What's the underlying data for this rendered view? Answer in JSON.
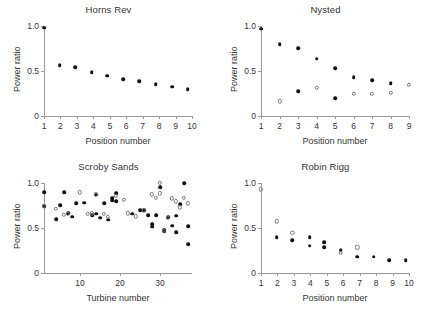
{
  "figure": {
    "panel_count": 4,
    "marker_colors": {
      "filled": "#111111",
      "open_stroke": "#777777",
      "axis": "#999999",
      "text": "#333333"
    }
  },
  "panels": [
    {
      "key": "horns_rev",
      "title": "Horns Rev",
      "xlabel": "Position number",
      "ylabel": "Power ratio",
      "yticks": [
        "1.0",
        "0.5",
        "0"
      ],
      "xticks": [
        "1",
        "2",
        "3",
        "4",
        "5",
        "6",
        "7",
        "8",
        "9",
        "10"
      ]
    },
    {
      "key": "nysted",
      "title": "Nysted",
      "xlabel": "Position number",
      "ylabel": "Power ratio",
      "yticks": [
        "1.0",
        "0.5",
        "0"
      ],
      "xticks": [
        "1",
        "2",
        "3",
        "4",
        "5",
        "6",
        "7",
        "8",
        "9"
      ]
    },
    {
      "key": "scroby_sands",
      "title": "Scroby Sands",
      "xlabel": "Turbine number",
      "ylabel": "Power ratio",
      "yticks": [
        "1.0",
        "0.5",
        "0"
      ],
      "xticks": [
        "10",
        "20",
        "30"
      ]
    },
    {
      "key": "robin_rigg",
      "title": "Robin Rigg",
      "xlabel": "Position number",
      "ylabel": "Power ratio",
      "yticks": [
        "1.0",
        "0.5",
        "0"
      ],
      "xticks": [
        "1",
        "2",
        "3",
        "4",
        "5",
        "6",
        "7",
        "8",
        "9",
        "10"
      ]
    }
  ],
  "chart_data": [
    {
      "type": "scatter",
      "title": "Horns Rev",
      "xlabel": "Position number",
      "ylabel": "Power ratio",
      "xlim": [
        1,
        10
      ],
      "ylim": [
        0,
        1.0
      ],
      "xticks": [
        1,
        2,
        3,
        4,
        5,
        6,
        7,
        8,
        9,
        10
      ],
      "yticks": [
        0,
        0.5,
        1.0
      ],
      "grid": false,
      "legend": "none",
      "series": [
        {
          "name": "power ratio (filled)",
          "marker": "filled-circle",
          "x": [
            1.0,
            1.95,
            2.9,
            3.9,
            4.85,
            5.8,
            6.8,
            7.8,
            8.8,
            9.75
          ],
          "y": [
            0.98,
            0.565,
            0.54,
            0.485,
            0.45,
            0.41,
            0.385,
            0.355,
            0.325,
            0.3
          ]
        }
      ]
    },
    {
      "type": "scatter",
      "title": "Nysted",
      "xlabel": "Position number",
      "ylabel": "Power ratio",
      "xlim": [
        1,
        9
      ],
      "ylim": [
        0,
        1.0
      ],
      "xticks": [
        1,
        2,
        3,
        4,
        5,
        6,
        7,
        8,
        9
      ],
      "yticks": [
        0,
        0.5,
        1.0
      ],
      "grid": false,
      "legend": "none",
      "series": [
        {
          "name": "upper (filled)",
          "marker": "filled-circle",
          "x": [
            1.0,
            2.0,
            3.0,
            4.0,
            5.0,
            6.0,
            7.0,
            8.0
          ],
          "y": [
            0.97,
            0.8,
            0.755,
            0.635,
            0.53,
            0.43,
            0.395,
            0.365
          ]
        },
        {
          "name": "lower (filled)",
          "marker": "filled-circle",
          "x": [
            3.0,
            5.0
          ],
          "y": [
            0.275,
            0.2
          ]
        },
        {
          "name": "open",
          "marker": "open-circle",
          "x": [
            2.0,
            4.0,
            6.0,
            7.0,
            8.0,
            9.0
          ],
          "y": [
            0.165,
            0.315,
            0.245,
            0.245,
            0.26,
            0.35
          ]
        }
      ]
    },
    {
      "type": "scatter",
      "title": "Scroby Sands",
      "xlabel": "Turbine number",
      "ylabel": "Power ratio",
      "xlim": [
        1,
        38
      ],
      "ylim": [
        0,
        1.0
      ],
      "xticks": [
        10,
        20,
        30
      ],
      "yticks": [
        0,
        0.5,
        1.0
      ],
      "grid": false,
      "legend": "none",
      "series": [
        {
          "name": "filled",
          "marker": "filled-circle",
          "x": [
            1,
            1,
            4,
            5,
            6,
            7,
            8,
            9,
            11,
            13,
            14,
            14,
            15,
            16,
            17,
            18,
            18,
            19,
            19,
            23,
            25,
            26,
            27,
            28,
            28,
            29,
            30,
            31,
            31,
            32,
            33,
            34,
            34,
            35,
            36,
            37,
            37
          ],
          "y": [
            0.9,
            0.745,
            0.6,
            0.755,
            0.9,
            0.665,
            0.625,
            0.775,
            0.78,
            0.645,
            0.87,
            0.66,
            0.615,
            0.775,
            0.59,
            0.81,
            0.835,
            0.8,
            0.885,
            0.66,
            0.7,
            0.695,
            0.64,
            0.545,
            0.515,
            0.645,
            0.955,
            0.465,
            0.48,
            0.62,
            0.525,
            0.455,
            0.635,
            0.765,
            1.0,
            0.52,
            0.32
          ]
        },
        {
          "name": "open",
          "marker": "open-circle",
          "x": [
            1,
            4,
            6,
            7,
            10,
            12,
            13,
            14,
            16,
            17,
            19,
            21,
            22,
            24,
            26,
            28,
            29,
            30,
            30,
            31,
            32,
            33,
            34,
            35,
            36,
            37
          ],
          "y": [
            0.745,
            0.715,
            0.645,
            0.66,
            0.895,
            0.655,
            0.665,
            0.875,
            0.66,
            0.625,
            0.855,
            0.81,
            0.665,
            0.63,
            0.695,
            0.875,
            0.835,
            1.0,
            0.885,
            0.47,
            0.61,
            0.83,
            0.795,
            0.73,
            0.835,
            0.775
          ]
        }
      ]
    },
    {
      "type": "scatter",
      "title": "Robin Rigg",
      "xlabel": "Position number",
      "ylabel": "Power ratio",
      "xlim": [
        1,
        10
      ],
      "ylim": [
        0,
        1.0
      ],
      "xticks": [
        1,
        2,
        3,
        4,
        5,
        6,
        7,
        8,
        9,
        10
      ],
      "yticks": [
        0,
        0.5,
        1.0
      ],
      "grid": false,
      "legend": "none",
      "series": [
        {
          "name": "filled",
          "marker": "filled-circle",
          "x": [
            1.95,
            2.9,
            3.95,
            3.95,
            4.85,
            4.85,
            5.85,
            6.85,
            7.85,
            8.8,
            9.8
          ],
          "y": [
            0.395,
            0.365,
            0.395,
            0.305,
            0.345,
            0.285,
            0.255,
            0.18,
            0.18,
            0.145,
            0.14
          ]
        },
        {
          "name": "open",
          "marker": "open-circle",
          "x": [
            1.0,
            1.95,
            2.9,
            5.85,
            6.85
          ],
          "y": [
            0.93,
            0.575,
            0.445,
            0.225,
            0.285
          ]
        }
      ]
    }
  ]
}
